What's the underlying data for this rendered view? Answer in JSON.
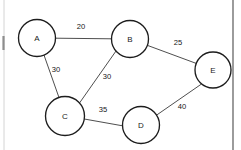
{
  "figure": {
    "type": "undirected-weighted-graph",
    "background_color": "#ffffff",
    "node_stroke_color": "#1d1d1d",
    "edge_stroke_color": "#3a3a3a",
    "label_color": "#1a1a1a",
    "width": 241,
    "height": 150
  },
  "nodes": [
    {
      "id": "A",
      "label": "A",
      "cx": 37,
      "cy": 38,
      "r": 18.5
    },
    {
      "id": "B",
      "label": "B",
      "cx": 130,
      "cy": 39,
      "r": 18.5
    },
    {
      "id": "C",
      "label": "C",
      "cx": 65,
      "cy": 116,
      "r": 19.5
    },
    {
      "id": "D",
      "label": "D",
      "cx": 141,
      "cy": 125,
      "r": 18.5
    },
    {
      "id": "E",
      "label": "E",
      "cx": 213,
      "cy": 70,
      "r": 18.0
    }
  ],
  "edges": [
    {
      "from": "A",
      "to": "B",
      "weight": "20",
      "label_x": 81,
      "label_y": 27,
      "x1": 55.5,
      "y1": 38.2,
      "x2": 111.5,
      "y2": 38.8
    },
    {
      "from": "A",
      "to": "C",
      "weight": "30",
      "label_x": 56,
      "label_y": 70,
      "x1": 44.0,
      "y1": 55.1,
      "x2": 58.8,
      "y2": 97.0
    },
    {
      "from": "B",
      "to": "C",
      "weight": "30",
      "label_x": 107,
      "label_y": 77,
      "x1": 116.0,
      "y1": 51.0,
      "x2": 79.5,
      "y2": 103.0
    },
    {
      "from": "B",
      "to": "E",
      "weight": "25",
      "label_x": 178,
      "label_y": 43,
      "x1": 147.8,
      "y1": 45.5,
      "x2": 196.5,
      "y2": 63.5
    },
    {
      "from": "C",
      "to": "D",
      "weight": "35",
      "label_x": 103,
      "label_y": 110,
      "x1": 84.3,
      "y1": 119.0,
      "x2": 122.5,
      "y2": 125.8
    },
    {
      "from": "D",
      "to": "E",
      "weight": "40",
      "label_x": 182,
      "label_y": 107,
      "x1": 156.0,
      "y1": 115.5,
      "x2": 201.5,
      "y2": 84.0
    }
  ],
  "page_artifacts": {
    "right_border": {
      "x": 233,
      "y1": 0,
      "y2": 150
    },
    "left_faint_line": {
      "x": 4,
      "y1": 0,
      "y2": 150
    },
    "left_dark_mark": {
      "x": 3.5,
      "y1": 36,
      "y2": 50
    }
  }
}
